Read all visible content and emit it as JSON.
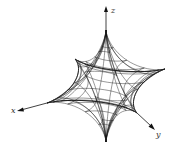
{
  "figure": {
    "axes": {
      "x": {
        "label": "x"
      },
      "y": {
        "label": "y"
      },
      "z": {
        "label": "z"
      }
    },
    "colors": {
      "line": "#1a1a1a",
      "background": "#ffffff"
    },
    "mesh": {
      "u_lines": 16,
      "v_lines": 12
    }
  }
}
